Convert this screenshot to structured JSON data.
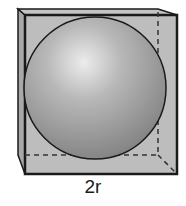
{
  "figure": {
    "dimension_label": "2r",
    "colors": {
      "cube_face": "#b9b9b9",
      "cube_edge": "#1a1a1a",
      "sphere_highlight": "#ececec",
      "sphere_shadow": "#7d7d7d",
      "background": "#ffffff"
    }
  }
}
